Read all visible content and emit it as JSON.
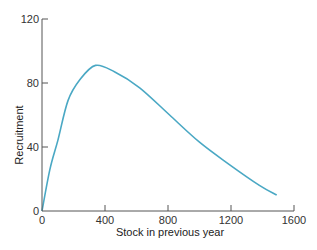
{
  "chart_data": {
    "type": "line",
    "title": "",
    "xlabel": "Stock in previous year",
    "ylabel": "Recruitment",
    "xlim": [
      0,
      1600
    ],
    "ylim": [
      0,
      120
    ],
    "xticks": [
      0,
      400,
      800,
      1200,
      1600
    ],
    "yticks": [
      0,
      40,
      80,
      120
    ],
    "grid": false,
    "legend": null,
    "series": [
      {
        "name": "Recruitment curve",
        "color": "#4aa8c4",
        "x": [
          0,
          50,
          100,
          165,
          240,
          340,
          460,
          620,
          810,
          1000,
          1190,
          1380,
          1490
        ],
        "y": [
          0,
          26,
          44,
          69,
          82,
          91,
          87,
          77,
          60,
          43,
          29,
          16,
          10
        ]
      }
    ]
  },
  "colors": {
    "axis": "#555555",
    "line": "#4aa8c4"
  }
}
